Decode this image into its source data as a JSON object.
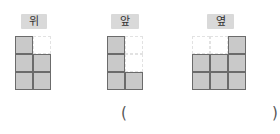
{
  "views": [
    {
      "label": "위",
      "cols": 2,
      "rows": 3,
      "cells": [
        [
          1,
          0
        ],
        [
          1,
          1
        ],
        [
          1,
          1
        ]
      ]
    },
    {
      "label": "앞",
      "cols": 2,
      "rows": 3,
      "cells": [
        [
          1,
          0
        ],
        [
          1,
          0
        ],
        [
          1,
          1
        ]
      ]
    },
    {
      "label": "옆",
      "cols": 3,
      "rows": 3,
      "cells": [
        [
          0,
          0,
          1
        ],
        [
          1,
          1,
          1
        ],
        [
          1,
          1,
          1
        ]
      ]
    }
  ],
  "answer": {
    "open_paren": "(",
    "close_paren": ")",
    "value": ""
  },
  "colors": {
    "filled_cell": "#c9c9c9",
    "cell_border": "#6b6b6b",
    "badge_bg": "#d9d9d9"
  }
}
